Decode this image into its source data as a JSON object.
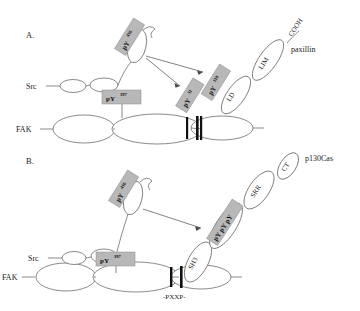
{
  "figure": {
    "background": "#ffffff",
    "label_fill": "#b8b8b8",
    "stroke": "#6d6d6d",
    "panels": [
      {
        "id": "A",
        "letter": "A.",
        "complex_name": "paxillin",
        "molecules": [
          {
            "name": "FAK",
            "label": "FAK"
          },
          {
            "name": "Src",
            "label": "Src"
          },
          {
            "name": "paxillin",
            "label": "paxillin"
          }
        ],
        "domains": [
          {
            "label": "LD"
          },
          {
            "label": "LIM"
          },
          {
            "label": "COOH"
          }
        ],
        "phospho_labels": [
          {
            "label": "pY",
            "superscript": "416"
          },
          {
            "label": "pY",
            "superscript": "397"
          },
          {
            "label": "pY",
            "superscript": "31"
          },
          {
            "label": "pY",
            "superscript": "118"
          }
        ]
      },
      {
        "id": "B",
        "letter": "B.",
        "complex_name": "p130Cas",
        "molecules": [
          {
            "name": "FAK",
            "label": "FAK"
          },
          {
            "name": "Src",
            "label": "Src"
          },
          {
            "name": "p130Cas",
            "label": "p130Cas"
          }
        ],
        "domains": [
          {
            "label": "SH3"
          },
          {
            "label": "SH2BD"
          },
          {
            "label": "SRR"
          },
          {
            "label": "CT"
          },
          {
            "label": "-PXXP-"
          }
        ],
        "phospho_labels": [
          {
            "label": "pY",
            "superscript": "416"
          },
          {
            "label": "pY",
            "superscript": "397"
          },
          {
            "label": "pY pY pY",
            "superscript": ""
          }
        ]
      }
    ]
  }
}
